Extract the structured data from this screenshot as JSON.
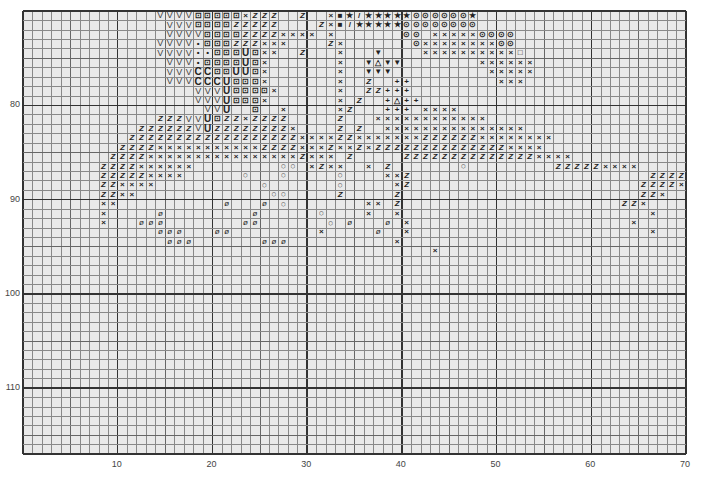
{
  "chart_data": {
    "type": "heatmap",
    "title": "",
    "subtitle": "",
    "xlabel": "",
    "ylabel": "",
    "x_range": [
      1,
      70
    ],
    "y_range": [
      71,
      117
    ],
    "grid": true,
    "x_ticks": [
      10,
      20,
      30,
      40,
      50,
      60,
      70
    ],
    "y_ticks": [
      80,
      90,
      100,
      110
    ],
    "legend": {
      "V": "V",
      "B": "⊡",
      "x": "×",
      "Z": "Z",
      "*": "★",
      "/": "/",
      "o": "⊙",
      "O": "○",
      "0": "ø",
      "C": "C",
      "U": "U",
      "d": "•",
      "T": "▼",
      "A": "△",
      "+": "+",
      "s": "■",
      "q": "□"
    },
    "rows": [
      "..............VVVVBBBBBxZZZ..Z..xs*/*****oooooo*.....................",
      "...............VVVBBBBZZZZZ....Zxs/*****oooooooo.....................",
      "...............VVVVBBBBZZZZxxxx.x.......oo.xxxxxoooo..................",
      "..............VVVVdBBBZZZxxx....Zx.......oxxxxxxxxoo..................",
      "..............VVVVddBBBUBxx..Z...x...T....xxxxxxxxxxq.................",
      "...............VVVdBBBBUBx.......x..TATT........xxxxxx................",
      "...............VVVCCBBUUBx.......x..TTT..........xxxxx................",
      "...............VVVCCCUBBBx.......x..Z..++.........xxx.................",
      "..................VVVUBBBBx......x..ZZ+++.............................",
      "..................VVVUBBBx.......x.Z..+A++............................",
      "...................VVU..B..x.....xZ...+++.xxxx........................",
      "..............ZZZVVUBZZxZZZZ.....Z...xxxxxxxxxxxx.....................",
      "............ZZZZZZVUZZZZZZZZx....Z.Z..xxxxxxxxxxxxxxx.................",
      "...........ZZZZZZZZZZZZZZZZZZxxxxZZxxxxxxxZZZZZZxxxxxxxx..............",
      "..........ZZZZxxxxxxxxxxxZZZZxxxZxxZxZZZZZZZZZZZZZZxxxx...............",
      ".........ZZZZxxxxxxxxxxxxxxxxZxxx.Z.....ZZZZZZZZZZZZZZxxxx............",
      "........ZZZZxxxxxx.........OO.xZxx..x.Z.......O.........ZZZZZxxxx.....",
      "........ZZZZZxxxx......O...O.....O....xxZ.........................ZZZZx",
      "........ZZxxxx...........O.......O.....xZ........................ZZZZx",
      "........ZZxx..............OO.....Z.....Z.........................ZZx..",
      "........xx...........0...0.O........xx.Z.......................ZZx...",
      "........x.....0.........0......O....x..x..........................x..",
      "........x...000........00.......O.0...0.x.......................x....",
      "..............000...00.........x.....0..x.........................x...",
      "...............000.......000...........x..............................",
      "...........................................x..........................",
      "......................................................................",
      "......................................................................",
      "......................................................................",
      "......................................................................",
      "......................................................................",
      "......................................................................",
      "......................................................................",
      "......................................................................",
      "......................................................................",
      "......................................................................",
      "......................................................................",
      "......................................................................",
      "......................................................................",
      "......................................................................",
      "......................................................................",
      "......................................................................",
      "......................................................................",
      "......................................................................",
      "......................................................................",
      "......................................................................",
      "......................................................................"
    ]
  },
  "axes": {
    "y_labels": [
      {
        "value": "80",
        "row": 80
      },
      {
        "value": "90",
        "row": 90
      },
      {
        "value": "100",
        "row": 100
      },
      {
        "value": "110",
        "row": 110
      }
    ],
    "x_labels": [
      {
        "value": "10",
        "col": 10
      },
      {
        "value": "20",
        "col": 20
      },
      {
        "value": "30",
        "col": 30
      },
      {
        "value": "40",
        "col": 40
      },
      {
        "value": "50",
        "col": 50
      },
      {
        "value": "60",
        "col": 60
      },
      {
        "value": "70",
        "col": 70
      }
    ]
  }
}
